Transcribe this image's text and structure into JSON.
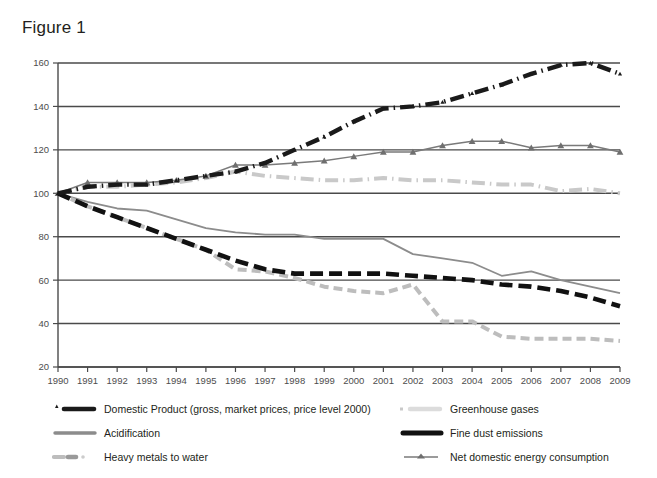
{
  "title": "Figure 1",
  "chart_data": {
    "type": "line",
    "title": "Figure 1",
    "xlabel": "",
    "ylabel": "",
    "grid": true,
    "legend_position": "bottom",
    "x": [
      1990,
      1991,
      1992,
      1993,
      1994,
      1995,
      1996,
      1997,
      1998,
      1999,
      2000,
      2001,
      2002,
      2003,
      2004,
      2005,
      2006,
      2007,
      2008,
      2009
    ],
    "xlim": [
      1990,
      2009
    ],
    "ylim": [
      20,
      160
    ],
    "yticks": [
      20,
      40,
      60,
      80,
      100,
      120,
      140,
      160
    ],
    "xticks": [
      "1990",
      "1991",
      "1992",
      "1993",
      "1994",
      "1995",
      "1996",
      "1997",
      "1998",
      "1999",
      "2000",
      "2001",
      "2002",
      "2003",
      "2004",
      "2005",
      "2006",
      "2007",
      "2008",
      "2009"
    ],
    "series": [
      {
        "name": "Domestic Product (gross, market prices, price level 2000)",
        "style": "dash-dot-thick-black",
        "color": "#1a1a1a",
        "marker": "triangle-small",
        "values": [
          100,
          103,
          104,
          104,
          106,
          108,
          110,
          114,
          120,
          126,
          133,
          139,
          140,
          142,
          146,
          150,
          155,
          159,
          160,
          155
        ]
      },
      {
        "name": "Greenhouse gases",
        "style": "dash-dot-light-grey",
        "color": "#c9c9c9",
        "marker": "none",
        "values": [
          100,
          103,
          103,
          104,
          105,
          107,
          110,
          108,
          107,
          106,
          106,
          107,
          106,
          106,
          105,
          104,
          104,
          101,
          102,
          100
        ]
      },
      {
        "name": "Acidification",
        "style": "solid-grey",
        "color": "#8c8c8c",
        "marker": "none",
        "values": [
          100,
          96,
          93,
          92,
          88,
          84,
          82,
          81,
          81,
          79,
          79,
          79,
          72,
          70,
          68,
          62,
          64,
          60,
          57,
          54
        ]
      },
      {
        "name": "Fine dust emissions",
        "style": "dash-thick-black",
        "color": "#111111",
        "marker": "none",
        "values": [
          100,
          94,
          89,
          84,
          79,
          74,
          69,
          65,
          63,
          63,
          63,
          63,
          62,
          61,
          60,
          58,
          57,
          55,
          52,
          48
        ]
      },
      {
        "name": "Heavy metals to water",
        "style": "dash-light-grey",
        "color": "#bdbdbd",
        "marker": "none",
        "values": [
          100,
          94,
          89,
          84,
          79,
          74,
          65,
          64,
          61,
          57,
          55,
          54,
          58,
          41,
          41,
          34,
          33,
          33,
          33,
          32
        ]
      },
      {
        "name": "Net domestic energy consumption",
        "style": "solid-grey-triangles",
        "color": "#7a7a7a",
        "marker": "triangle",
        "values": [
          100,
          105,
          105,
          105,
          106,
          108,
          113,
          113,
          114,
          115,
          117,
          119,
          119,
          122,
          124,
          124,
          121,
          122,
          122,
          119
        ]
      }
    ]
  },
  "legend": {
    "items": [
      {
        "label": "Domestic Product (gross, market prices, price level 2000)",
        "key": "dash-dot-thick-black-with-triangle"
      },
      {
        "label": "Greenhouse gases",
        "key": "dash-dot-light-grey"
      },
      {
        "label": "Acidification",
        "key": "solid-grey"
      },
      {
        "label": "Fine dust emissions",
        "key": "dash-thick-black"
      },
      {
        "label": "Heavy metals to water",
        "key": "dash-light-grey"
      },
      {
        "label": "Net domestic energy consumption",
        "key": "solid-grey-triangle"
      }
    ]
  }
}
